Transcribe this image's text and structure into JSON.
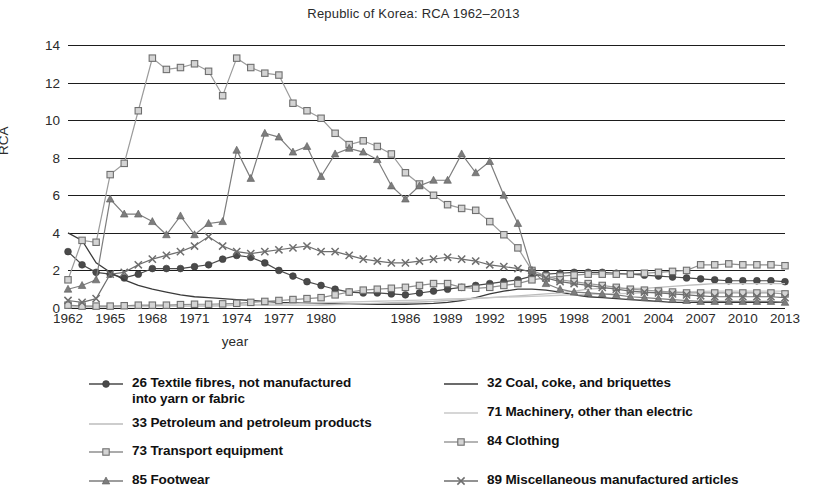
{
  "chart_data": {
    "type": "line",
    "title": "Republic of Korea: RCA 1962–2013",
    "xlabel": "year",
    "ylabel": "RCA",
    "ylim": [
      0,
      14
    ],
    "yticks": [
      0,
      2,
      4,
      6,
      8,
      10,
      12,
      14
    ],
    "xlim": [
      1962,
      2013
    ],
    "xticks": [
      1962,
      1965,
      1968,
      1971,
      1974,
      1977,
      1980,
      1986,
      1989,
      1992,
      1995,
      1998,
      2001,
      2004,
      2007,
      2010,
      2013
    ],
    "xticklabels": [
      "1962",
      "1965",
      "1968",
      "1971",
      "1974",
      "1977",
      "1980",
      "1986",
      "1989",
      "1992",
      "1995",
      "1998",
      "2001",
      "2004",
      "2007",
      "2010",
      "2013"
    ],
    "grid": "horizontal",
    "legend_position": "below",
    "x": [
      1962,
      1963,
      1964,
      1965,
      1966,
      1967,
      1968,
      1969,
      1970,
      1971,
      1972,
      1973,
      1974,
      1975,
      1976,
      1977,
      1978,
      1979,
      1980,
      1981,
      1982,
      1983,
      1984,
      1985,
      1986,
      1987,
      1988,
      1989,
      1990,
      1991,
      1992,
      1993,
      1994,
      1995,
      1996,
      1997,
      1998,
      1999,
      2000,
      2001,
      2002,
      2003,
      2004,
      2005,
      2006,
      2007,
      2008,
      2009,
      2010,
      2011,
      2012,
      2013
    ],
    "series": [
      {
        "name": "26 Textile fibres, not manufactured into yarn or fabric",
        "code": "26",
        "marker": "filled-circle",
        "color": "#4a4a4a",
        "values": [
          3.0,
          2.3,
          1.9,
          1.8,
          1.6,
          1.8,
          2.1,
          2.1,
          2.1,
          2.2,
          2.3,
          2.6,
          2.8,
          2.7,
          2.4,
          2.0,
          1.7,
          1.4,
          1.2,
          1.0,
          0.85,
          0.8,
          0.8,
          0.75,
          0.7,
          0.8,
          0.9,
          1.0,
          1.1,
          1.2,
          1.3,
          1.4,
          1.5,
          1.7,
          1.8,
          1.85,
          1.9,
          1.9,
          1.9,
          1.85,
          1.8,
          1.75,
          1.7,
          1.65,
          1.6,
          1.55,
          1.5,
          1.45,
          1.45,
          1.45,
          1.45,
          1.4
        ]
      },
      {
        "name": "32 Coal, coke, and briquettes",
        "code": "32",
        "marker": "none",
        "color": "#3a3a3a",
        "values": [
          4.0,
          3.6,
          2.4,
          1.9,
          1.5,
          1.2,
          1.0,
          0.85,
          0.7,
          0.6,
          0.55,
          0.5,
          0.45,
          0.4,
          0.35,
          0.3,
          0.28,
          0.26,
          0.24,
          0.22,
          0.2,
          0.2,
          0.2,
          0.2,
          0.2,
          0.22,
          0.25,
          0.3,
          0.4,
          0.55,
          0.75,
          0.9,
          1.0,
          1.0,
          0.95,
          0.85,
          0.7,
          0.6,
          0.55,
          0.5,
          0.45,
          0.4,
          0.35,
          0.3,
          0.3,
          0.3,
          0.3,
          0.3,
          0.3,
          0.3,
          0.3,
          0.3
        ]
      },
      {
        "name": "33 Petroleum and petroleum products",
        "code": "33",
        "marker": "none",
        "color": "#bcbcbc",
        "values": [
          0.1,
          0.1,
          0.1,
          0.1,
          0.1,
          0.1,
          0.1,
          0.1,
          0.1,
          0.1,
          0.1,
          0.12,
          0.15,
          0.15,
          0.15,
          0.15,
          0.15,
          0.15,
          0.15,
          0.18,
          0.2,
          0.22,
          0.25,
          0.28,
          0.3,
          0.32,
          0.35,
          0.4,
          0.45,
          0.5,
          0.55,
          0.6,
          0.65,
          0.7,
          0.75,
          0.8,
          0.9,
          1.0,
          1.05,
          1.05,
          1.05,
          1.05,
          1.1,
          1.15,
          1.2,
          1.25,
          1.3,
          1.3,
          1.3,
          1.3,
          1.3,
          1.3
        ]
      },
      {
        "name": "71 Machinery, other than electric",
        "code": "71",
        "marker": "none",
        "color": "#c8c8c8",
        "values": [
          0.05,
          0.05,
          0.05,
          0.05,
          0.06,
          0.07,
          0.08,
          0.09,
          0.1,
          0.11,
          0.12,
          0.14,
          0.16,
          0.18,
          0.2,
          0.22,
          0.24,
          0.26,
          0.28,
          0.3,
          0.32,
          0.34,
          0.36,
          0.38,
          0.4,
          0.42,
          0.45,
          0.48,
          0.5,
          0.52,
          0.55,
          0.58,
          0.6,
          0.62,
          0.65,
          0.68,
          0.7,
          0.72,
          0.74,
          0.76,
          0.78,
          0.8,
          0.82,
          0.84,
          0.86,
          0.88,
          0.9,
          0.9,
          0.9,
          0.9,
          0.9,
          0.9
        ]
      },
      {
        "name": "73 Transport equipment",
        "code": "73",
        "marker": "square",
        "color": "#8f8f8f",
        "values": [
          0.15,
          0.1,
          0.1,
          0.1,
          0.12,
          0.15,
          0.15,
          0.15,
          0.18,
          0.2,
          0.2,
          0.22,
          0.25,
          0.3,
          0.35,
          0.4,
          0.45,
          0.5,
          0.55,
          0.7,
          0.85,
          0.95,
          1.0,
          1.05,
          1.1,
          1.2,
          1.3,
          1.3,
          1.1,
          1.05,
          1.1,
          1.2,
          1.3,
          1.5,
          1.6,
          1.7,
          1.75,
          1.8,
          1.8,
          1.8,
          1.8,
          1.85,
          1.9,
          1.95,
          2.0,
          2.3,
          2.3,
          2.35,
          2.3,
          2.3,
          2.3,
          2.25
        ]
      },
      {
        "name": "84 Clothing",
        "code": "84",
        "marker": "square",
        "color": "#9b9b9b",
        "values": [
          1.5,
          3.6,
          3.5,
          7.1,
          7.7,
          10.5,
          13.3,
          12.7,
          12.8,
          13.0,
          12.6,
          11.3,
          13.3,
          12.8,
          12.5,
          12.4,
          10.9,
          10.5,
          10.1,
          9.3,
          8.7,
          8.9,
          8.6,
          8.2,
          7.2,
          6.6,
          6.0,
          5.5,
          5.3,
          5.2,
          4.6,
          3.9,
          3.2,
          2.0,
          1.7,
          1.5,
          1.4,
          1.3,
          1.2,
          1.1,
          1.0,
          0.95,
          0.9,
          0.85,
          0.8,
          0.8,
          0.8,
          0.8,
          0.8,
          0.8,
          0.8,
          0.75
        ]
      },
      {
        "name": "85 Footwear",
        "code": "85",
        "marker": "triangle",
        "color": "#7d7d7d",
        "values": [
          1.0,
          1.2,
          1.5,
          5.8,
          5.0,
          5.0,
          4.6,
          3.9,
          4.9,
          3.9,
          4.5,
          4.6,
          8.4,
          6.9,
          9.3,
          9.1,
          8.3,
          8.6,
          7.0,
          8.2,
          8.5,
          8.3,
          7.9,
          6.5,
          5.8,
          6.5,
          6.8,
          6.8,
          8.2,
          7.2,
          7.8,
          6.0,
          4.5,
          2.0,
          1.3,
          1.0,
          0.85,
          0.8,
          0.75,
          0.7,
          0.6,
          0.55,
          0.5,
          0.45,
          0.4,
          0.35,
          0.35,
          0.35,
          0.35,
          0.35,
          0.35,
          0.3
        ]
      },
      {
        "name": "89 Miscellaneous manufactured articles",
        "code": "89",
        "marker": "x",
        "color": "#6e6e6e",
        "values": [
          0.4,
          0.3,
          0.5,
          1.8,
          1.9,
          2.3,
          2.6,
          2.8,
          3.0,
          3.3,
          3.8,
          3.3,
          3.0,
          2.9,
          3.0,
          3.1,
          3.2,
          3.3,
          3.0,
          3.0,
          2.8,
          2.6,
          2.5,
          2.4,
          2.4,
          2.5,
          2.6,
          2.7,
          2.6,
          2.5,
          2.3,
          2.2,
          2.1,
          1.9,
          1.6,
          1.4,
          1.3,
          1.2,
          1.1,
          1.0,
          0.9,
          0.85,
          0.8,
          0.75,
          0.7,
          0.65,
          0.6,
          0.6,
          0.6,
          0.6,
          0.6,
          0.55
        ]
      }
    ]
  },
  "legend": {
    "left_items": [
      {
        "label": "26 Textile fibres, not manufactured\ninto yarn or fabric",
        "marker": "filled-circle",
        "color": "#4a4a4a"
      },
      {
        "label": "33 Petroleum and petroleum products",
        "marker": "none",
        "color": "#bcbcbc"
      },
      {
        "label": "73 Transport equipment",
        "marker": "square",
        "color": "#8f8f8f"
      },
      {
        "label": "85 Footwear",
        "marker": "triangle",
        "color": "#7d7d7d"
      }
    ],
    "right_items": [
      {
        "label": "32 Coal, coke, and briquettes",
        "marker": "none",
        "color": "#3a3a3a"
      },
      {
        "label": "71 Machinery, other than electric",
        "marker": "none",
        "color": "#c8c8c8"
      },
      {
        "label": "84 Clothing",
        "marker": "square",
        "color": "#9b9b9b"
      },
      {
        "label": "89 Miscellaneous manufactured articles",
        "marker": "x",
        "color": "#6e6e6e"
      }
    ]
  }
}
